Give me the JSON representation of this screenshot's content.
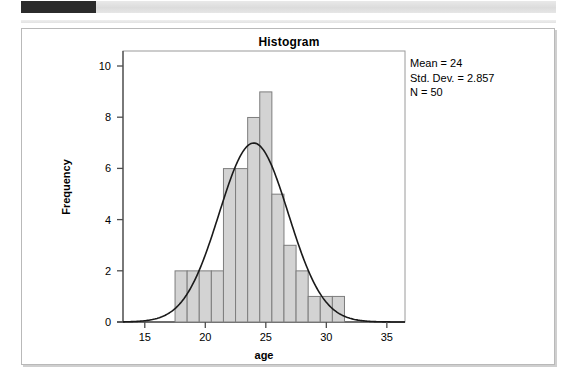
{
  "header": {
    "dark_band": "",
    "light_band": ""
  },
  "figure": {
    "title": "Histogram"
  },
  "stats": {
    "mean_line": "Mean = 24",
    "stddev_line": "Std. Dev. = 2.857",
    "n_line": "N = 50"
  },
  "colors": {
    "bar_fill": "#d3d3d3",
    "bar_stroke": "#7d7d7d",
    "curve": "#1a1a1a",
    "axis": "#4d4d4d",
    "frame": "#b9b9b9",
    "plot_border": "#9a9a9a",
    "text": "#000000"
  },
  "chart_data": {
    "type": "bar",
    "title": "Histogram",
    "xlabel": "age",
    "ylabel": "Frequency",
    "xlim": [
      13.2,
      36.5
    ],
    "ylim": [
      0,
      10.6
    ],
    "xticks": [
      15,
      20,
      25,
      30,
      35
    ],
    "yticks": [
      0,
      2,
      4,
      6,
      8,
      10
    ],
    "grid": false,
    "bin_width": 1,
    "bin_starts": [
      17.5,
      18.5,
      19.5,
      20.5,
      21.5,
      22.5,
      23.5,
      24.5,
      25.5,
      26.5,
      27.5,
      28.5,
      29.5,
      30.5
    ],
    "bin_centers": [
      18,
      19,
      20,
      21,
      22,
      23,
      24,
      25,
      26,
      27,
      28,
      29,
      30,
      31
    ],
    "categories": [
      "18",
      "19",
      "20",
      "21",
      "22",
      "23",
      "24",
      "25",
      "26",
      "27",
      "28",
      "29",
      "30",
      "31"
    ],
    "values": [
      2,
      2,
      2,
      2,
      6,
      6,
      8,
      9,
      5,
      3,
      2,
      1,
      1,
      1
    ],
    "overlay": {
      "type": "normal-curve",
      "mean": 24,
      "std_dev": 2.857,
      "n": 50,
      "peak_value": 7,
      "label": "Normal distribution curve"
    },
    "annotations": [
      "Mean = 24",
      "Std. Dev. = 2.857",
      "N = 50"
    ]
  }
}
